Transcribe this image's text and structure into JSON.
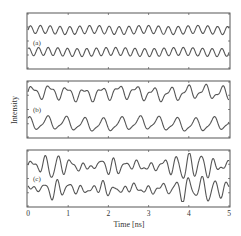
{
  "chart_data": {
    "type": "line",
    "title": "",
    "xlabel": "Time [ns]",
    "ylabel": "Intensity",
    "xlim": [
      0,
      5
    ],
    "xticks": [
      0,
      1,
      2,
      3,
      4,
      5
    ],
    "xtick_labels": [
      "0",
      "1",
      "2",
      "3",
      "4",
      "5"
    ],
    "grid": false,
    "legend": null,
    "x_step_ns": 0.05,
    "panels": [
      {
        "label": "(a)",
        "description": "Two nearly periodic small-amplitude oscillations (~0.25 ns period)",
        "series": [
          {
            "name": "(a) upper trace",
            "period_ns": 0.24,
            "amplitude": 0.35
          },
          {
            "name": "(a) lower trace",
            "period_ns": 0.24,
            "amplitude": 0.35
          }
        ]
      },
      {
        "label": "(b)",
        "description": "Two irregular oscillations (~0.4-0.5 ns period) with moderate amplitude",
        "series": [
          {
            "name": "(b) upper trace",
            "period_ns": 0.42,
            "amplitude": 0.7
          },
          {
            "name": "(b) lower trace",
            "period_ns": 0.45,
            "amplitude": 0.7
          }
        ]
      },
      {
        "label": "(c)",
        "description": "Two chaotic large-amplitude oscillations with deep dips near 0.6, 2.0, 3.9 and 4.5 ns",
        "series": [
          {
            "name": "(c) upper trace",
            "dips_ns": [
              0.6,
              2.0,
              3.85,
              4.45
            ]
          },
          {
            "name": "(c) lower trace",
            "dips_ns": [
              0.6,
              2.0,
              3.85,
              4.5
            ]
          }
        ]
      }
    ]
  },
  "figure": {
    "panel_labels": [
      "(a)",
      "(b)",
      "(c)"
    ],
    "xlabel": "Time [ns]",
    "ylabel": "Intensity",
    "xtick_labels": [
      "0",
      "1",
      "2",
      "3",
      "4",
      "5"
    ],
    "line_color": "#555555",
    "frame_color": "#444444"
  }
}
